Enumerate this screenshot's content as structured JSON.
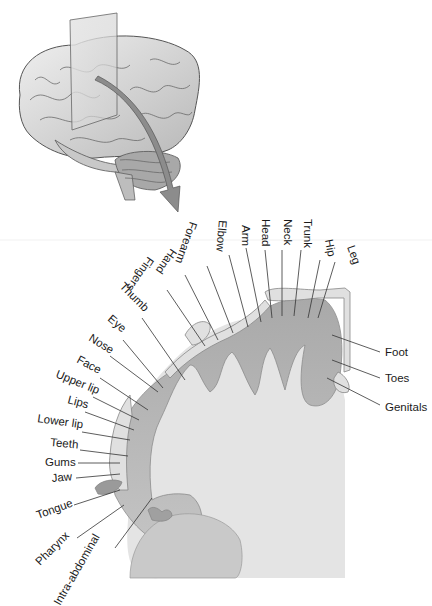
{
  "figure": {
    "brain_view": "lateral brain with coronal slicing plane and arrow",
    "section_view": "coronal section of precentral gyrus (primary motor cortex)"
  },
  "colors": {
    "background": "#ffffff",
    "cortex_gray": "#b4b4b4",
    "white_matter": "#e2e2e2",
    "plane": "#d8d8d8",
    "arrow": "#8c8c8c",
    "text": "#1a1a1a"
  },
  "labels": {
    "top": [
      {
        "text": "Leg",
        "x": 347,
        "y": 247,
        "rot": 70,
        "lx1": 335,
        "ly1": 262,
        "lx2": 318,
        "ly2": 318
      },
      {
        "text": "Hip",
        "x": 325,
        "y": 240,
        "rot": 80,
        "lx1": 320,
        "ly1": 260,
        "lx2": 308,
        "ly2": 318
      },
      {
        "text": "Trunk",
        "x": 304,
        "y": 219,
        "rot": 90,
        "lx1": 301,
        "ly1": 250,
        "lx2": 294,
        "ly2": 316
      },
      {
        "text": "Neck",
        "x": 284,
        "y": 219,
        "rot": 90,
        "lx1": 282,
        "ly1": 250,
        "lx2": 282,
        "ly2": 316
      },
      {
        "text": "Head",
        "x": 262,
        "y": 219,
        "rot": 90,
        "lx1": 265,
        "ly1": 250,
        "lx2": 272,
        "ly2": 318
      },
      {
        "text": "Arm",
        "x": 242,
        "y": 225,
        "rot": 90,
        "lx1": 246,
        "ly1": 248,
        "lx2": 261,
        "ly2": 322
      },
      {
        "text": "Elbow",
        "x": 219,
        "y": 220,
        "rot": 95,
        "lx1": 229,
        "ly1": 255,
        "lx2": 248,
        "ly2": 327
      },
      {
        "text": "Forearm",
        "x": 190,
        "y": 221,
        "rot": 110,
        "lx1": 207,
        "ly1": 266,
        "lx2": 233,
        "ly2": 333
      },
      {
        "text": "Hand",
        "x": 171,
        "y": 248,
        "rot": 125,
        "lx1": 185,
        "ly1": 275,
        "lx2": 218,
        "ly2": 340
      },
      {
        "text": "Fingers",
        "x": 148,
        "y": 256,
        "rot": 125,
        "lx1": 167,
        "ly1": 290,
        "lx2": 205,
        "ly2": 346
      }
    ],
    "left": [
      {
        "text": "Thumb",
        "x": 119,
        "y": 287,
        "rot": 45,
        "lx1": 142,
        "ly1": 318,
        "lx2": 185,
        "ly2": 380
      },
      {
        "text": "Eye",
        "x": 107,
        "y": 320,
        "rot": 40,
        "lx1": 123,
        "ly1": 340,
        "lx2": 163,
        "ly2": 388
      },
      {
        "text": "Nose",
        "x": 88,
        "y": 340,
        "rot": 32,
        "lx1": 110,
        "ly1": 356,
        "lx2": 158,
        "ly2": 392
      },
      {
        "text": "Face",
        "x": 76,
        "y": 362,
        "rot": 28,
        "lx1": 100,
        "ly1": 378,
        "lx2": 148,
        "ly2": 410
      },
      {
        "text": "Upper lip",
        "x": 55,
        "y": 377,
        "rot": 22,
        "lx1": 93,
        "ly1": 397,
        "lx2": 139,
        "ly2": 420
      },
      {
        "text": "Lips",
        "x": 67,
        "y": 403,
        "rot": 15,
        "lx1": 85,
        "ly1": 412,
        "lx2": 134,
        "ly2": 430
      },
      {
        "text": "Lower lip",
        "x": 37,
        "y": 422,
        "rot": 8,
        "lx1": 82,
        "ly1": 432,
        "lx2": 130,
        "ly2": 440
      },
      {
        "text": "Teeth",
        "x": 50,
        "y": 446,
        "rot": 5,
        "lx1": 80,
        "ly1": 450,
        "lx2": 128,
        "ly2": 456
      },
      {
        "text": "Gums",
        "x": 45,
        "y": 466,
        "rot": 0,
        "lx1": 78,
        "ly1": 463,
        "lx2": 120,
        "ly2": 463
      },
      {
        "text": "Jaw",
        "x": 52,
        "y": 482,
        "rot": -5,
        "lx1": 76,
        "ly1": 478,
        "lx2": 120,
        "ly2": 474
      },
      {
        "text": "Tongue",
        "x": 38,
        "y": 519,
        "rot": -20,
        "lx1": 74,
        "ly1": 505,
        "lx2": 120,
        "ly2": 490
      },
      {
        "text": "Pharynx",
        "x": 40,
        "y": 566,
        "rot": -45,
        "lx1": 77,
        "ly1": 538,
        "lx2": 124,
        "ly2": 505
      },
      {
        "text": "Intra-abdominal",
        "x": 60,
        "y": 606,
        "rot": -60,
        "lx1": 115,
        "ly1": 548,
        "lx2": 152,
        "ly2": 498
      }
    ],
    "right": [
      {
        "text": "Foot",
        "x": 385,
        "y": 356,
        "rot": 0,
        "lx1": 332,
        "ly1": 335,
        "lx2": 380,
        "ly2": 352
      },
      {
        "text": "Toes",
        "x": 385,
        "y": 382,
        "rot": 0,
        "lx1": 332,
        "ly1": 360,
        "lx2": 380,
        "ly2": 378
      },
      {
        "text": "Genitals",
        "x": 385,
        "y": 411,
        "rot": 0,
        "lx1": 327,
        "ly1": 378,
        "lx2": 380,
        "ly2": 405
      }
    ]
  }
}
